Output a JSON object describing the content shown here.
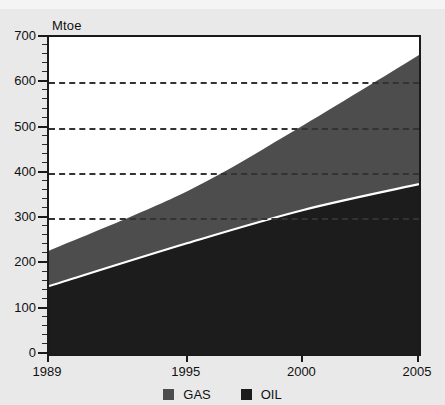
{
  "chart_data": {
    "type": "area",
    "stacked": true,
    "title": "",
    "subtitle": "",
    "xlabel": "",
    "ylabel": "Mtoe",
    "ylim": [
      0,
      700
    ],
    "xlim": [
      1989,
      2005
    ],
    "grid": true,
    "grid_style": "dashed-horizontal",
    "grid_values": [
      300,
      400,
      500,
      600
    ],
    "legend_position": "bottom-center",
    "x": [
      1989,
      1995,
      2000,
      2005
    ],
    "xtick_labels": [
      "1989",
      "1995",
      "2000",
      "2005"
    ],
    "ytick_labels": [
      "0",
      "100",
      "200",
      "300",
      "400",
      "500",
      "600",
      "700"
    ],
    "ytick_values": [
      0,
      100,
      200,
      300,
      400,
      500,
      600,
      700
    ],
    "ytick_minor_step": 20,
    "series": [
      {
        "name": "OIL",
        "color": "#1c1c1c",
        "values": [
          150,
          245,
          318,
          375
        ]
      },
      {
        "name": "GAS",
        "color": "#4d4d4d",
        "values": [
          78,
          115,
          187,
          285
        ]
      }
    ],
    "totals": [
      228,
      360,
      505,
      660
    ],
    "annotations": []
  },
  "axis": {
    "y_unit_label": "Mtoe"
  },
  "legend": {
    "items": [
      {
        "label": "GAS",
        "color": "#4d4d4d",
        "swatch_name": "legend-swatch-gas"
      },
      {
        "label": "OIL",
        "color": "#1c1c1c",
        "swatch_name": "legend-swatch-oil"
      }
    ]
  }
}
